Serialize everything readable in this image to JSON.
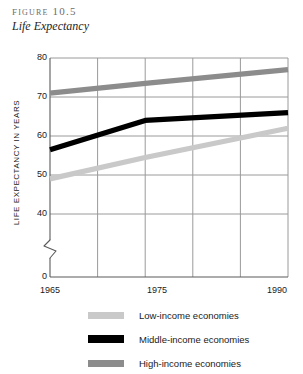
{
  "figure": {
    "label": "Figure 10.5",
    "subtitle": "Life Expectancy"
  },
  "axes": {
    "y_title": "LIFE EXPECTANCY IN YEARS",
    "y_ticks": [
      "80",
      "70",
      "60",
      "50",
      "40",
      "0"
    ],
    "x_ticks": [
      "1965",
      "1975",
      "1990"
    ],
    "axis_break": "zigzag-break"
  },
  "legend": {
    "items": [
      {
        "label": "Low-income economies",
        "color": "#c9c9c9"
      },
      {
        "label": "Middle-income economies",
        "color": "#000000"
      },
      {
        "label": "High-income economies",
        "color": "#8c8c8c"
      }
    ]
  },
  "chart_data": {
    "type": "line",
    "title": "Life Expectancy",
    "subtitle": "Figure 10.5",
    "xlabel": "",
    "ylabel": "LIFE EXPECTANCY IN YEARS",
    "x": [
      1965,
      1975,
      1990
    ],
    "xlim": [
      1965,
      1990
    ],
    "ylim": [
      40,
      80
    ],
    "y_axis_break_below": 40,
    "y_ticks": [
      80,
      70,
      60,
      50,
      40,
      0
    ],
    "x_ticks": [
      1965,
      1975,
      1990
    ],
    "x_gridlines": [
      1965,
      1970,
      1975,
      1980,
      1985,
      1990
    ],
    "grid": true,
    "legend_position": "below",
    "series": [
      {
        "name": "Low-income economies",
        "color": "#c9c9c9",
        "values": [
          49.0,
          54.5,
          62.0
        ]
      },
      {
        "name": "Middle-income economies",
        "color": "#000000",
        "values": [
          56.5,
          64.0,
          66.0
        ]
      },
      {
        "name": "High-income economies",
        "color": "#8c8c8c",
        "values": [
          71.0,
          73.5,
          77.0
        ]
      }
    ]
  }
}
